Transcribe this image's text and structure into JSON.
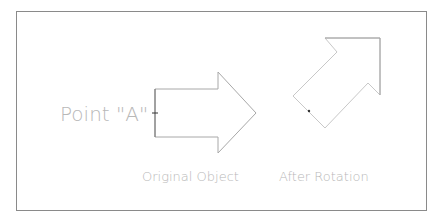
{
  "diagram": {
    "labels": {
      "point": "Point \"A\"",
      "original": "Original Object",
      "rotated": "After Rotation"
    },
    "colors": {
      "frame": "#8a8a8a",
      "original_outline": "#a0a0a0",
      "rotated_outline": "#c8c8c8",
      "text": "#b8b8b8",
      "point_marker": "#333333"
    },
    "shapes": {
      "original_arrow": "155,89 218,89 218,72 256,113 218,153 218,137 155,137",
      "rotated_arrow": "293,96 337,52 325,38 380,38 380,95 368,83 325,128"
    },
    "points": {
      "original_point_a": [
        155,
        113
      ],
      "rotated_point_a": [
        309,
        111
      ]
    }
  }
}
